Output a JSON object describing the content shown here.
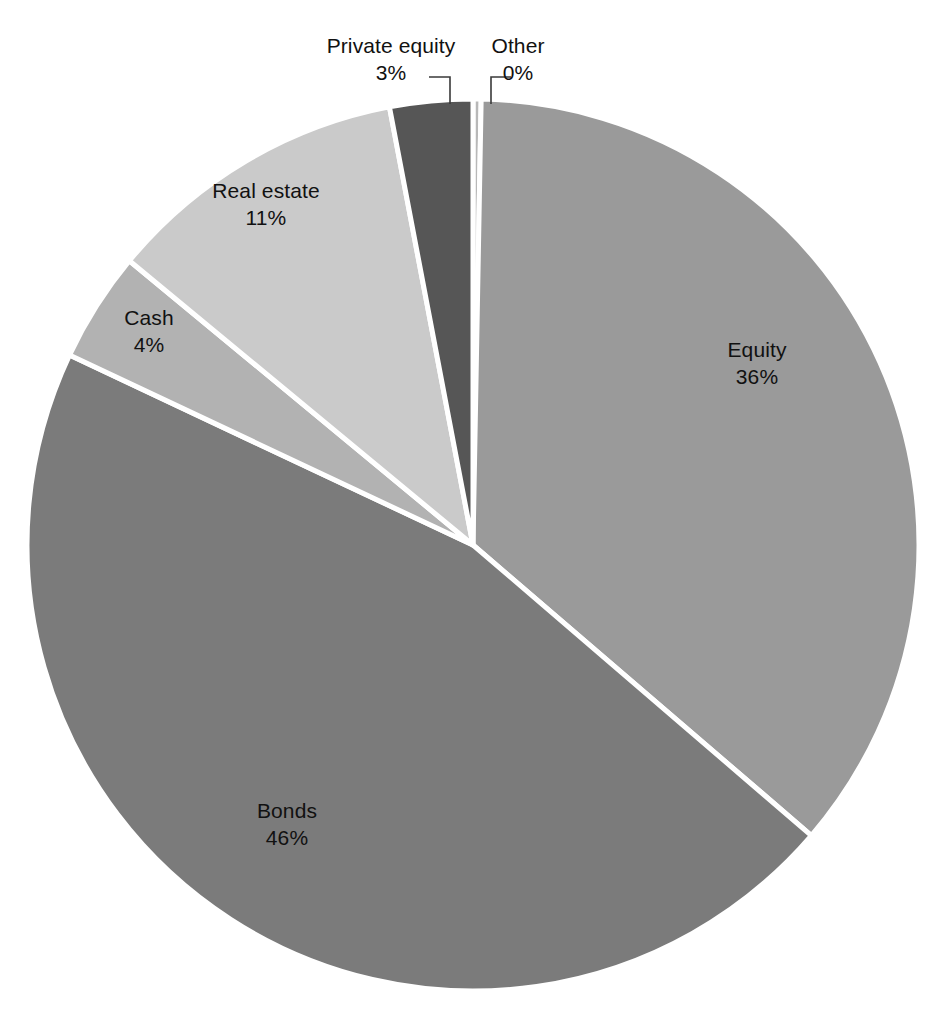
{
  "chart_data": {
    "type": "pie",
    "title": "",
    "subtitle": "",
    "xlabel": "",
    "ylabel": "",
    "legend": "none",
    "grid": false,
    "labels_format": "name + percent",
    "categories": [
      "Other",
      "Equity",
      "Bonds",
      "Cash",
      "Real estate",
      "Private equity"
    ],
    "values": [
      0,
      36,
      46,
      4,
      11,
      3
    ],
    "units": "percent",
    "start_angle_deg": 0,
    "direction": "clockwise",
    "slices": [
      {
        "name": "Other",
        "value": 0,
        "value_label": "0%",
        "color": "#b8b8b8",
        "label_placement": "outside-leader"
      },
      {
        "name": "Equity",
        "value": 36,
        "value_label": "36%",
        "color": "#9a9a9a",
        "label_placement": "inside"
      },
      {
        "name": "Bonds",
        "value": 46,
        "value_label": "46%",
        "color": "#7b7b7b",
        "label_placement": "inside"
      },
      {
        "name": "Cash",
        "value": 4,
        "value_label": "4%",
        "color": "#b2b2b2",
        "label_placement": "inside"
      },
      {
        "name": "Real estate",
        "value": 11,
        "value_label": "11%",
        "color": "#cacaca",
        "label_placement": "inside"
      },
      {
        "name": "Private equity",
        "value": 3,
        "value_label": "3%",
        "color": "#565656",
        "label_placement": "outside-leader"
      }
    ],
    "separator_color": "#ffffff",
    "background_color": "#ffffff"
  },
  "labels": {
    "equity": {
      "name": "Equity",
      "value": "36%"
    },
    "bonds": {
      "name": "Bonds",
      "value": "46%"
    },
    "real_estate": {
      "name": "Real estate",
      "value": "11%"
    },
    "cash": {
      "name": "Cash",
      "value": "4%"
    },
    "private_equity": {
      "name": "Private equity",
      "value": "3%"
    },
    "other": {
      "name": "Other",
      "value": "0%"
    }
  }
}
